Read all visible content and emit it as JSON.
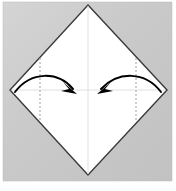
{
  "figure": {
    "canvas": {
      "width": 176,
      "height": 191
    },
    "colors": {
      "page_background": "#ffffff",
      "panel_background": "#c6c6c6",
      "panel_background_light": "#d9d9d9",
      "paper_fill": "#ffffff",
      "paper_outline": "#3a3a3a",
      "crease_line": "#e0e0e0",
      "dashed_line": "#a8a8a8",
      "arrow": "#000000"
    },
    "panel": {
      "name": "illustration-panel",
      "x": 3,
      "y": 2,
      "width": 169,
      "height": 179
    },
    "paper": {
      "name": "square-sheet-diamond",
      "shape": "diamond",
      "vertices": {
        "top": {
          "x": 88,
          "y": 5
        },
        "right": {
          "x": 167,
          "y": 90
        },
        "bottom": {
          "x": 88,
          "y": 175
        },
        "left": {
          "x": 10,
          "y": 90
        }
      },
      "outline_width": 1.4
    },
    "creases": [
      {
        "name": "vertical-center-crease",
        "orientation": "vertical",
        "x1": 88,
        "y1": 5,
        "x2": 88,
        "y2": 175,
        "style": "solid-faint"
      },
      {
        "name": "horizontal-center-crease",
        "orientation": "horizontal",
        "x1": 10,
        "y1": 90,
        "x2": 167,
        "y2": 90,
        "style": "solid-faint"
      }
    ],
    "fold_lines": [
      {
        "name": "left-fold-dashed-line",
        "x1": 40,
        "y1": 58,
        "x2": 40,
        "y2": 122,
        "style": "dashed",
        "dash_pattern": "2 2"
      },
      {
        "name": "right-fold-dashed-line",
        "x1": 136,
        "y1": 58,
        "x2": 136,
        "y2": 122,
        "style": "dashed",
        "dash_pattern": "2 2"
      }
    ],
    "arrows": [
      {
        "name": "left-fold-arrow",
        "direction": "left-to-center",
        "path": "M 15 92 C 30 72, 58 72, 75 90",
        "head": "M 75 92 L 64 83 L 70 90 L 62 91 Z",
        "start": {
          "x": 15,
          "y": 92
        },
        "end": {
          "x": 75,
          "y": 92
        },
        "stroke_width": 2
      },
      {
        "name": "right-fold-arrow",
        "direction": "right-to-center",
        "path": "M 161 92 C 146 72, 118 72, 99 90",
        "head": "M 99 92 L 110 83 L 104 90 L 112 91 Z",
        "start": {
          "x": 161,
          "y": 92
        },
        "end": {
          "x": 99,
          "y": 92
        },
        "stroke_width": 2
      }
    ]
  }
}
